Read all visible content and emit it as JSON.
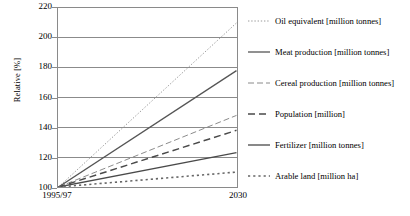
{
  "chart_data": {
    "type": "line",
    "title": "",
    "xlabel": "",
    "ylabel": "Relative [%]",
    "x": [
      "1995/97",
      "2030"
    ],
    "xtick_labels": [
      "1995/97",
      "2030"
    ],
    "ytick_labels": [
      "100",
      "120",
      "140",
      "160",
      "180",
      "200",
      "220"
    ],
    "ylim": [
      100,
      220
    ],
    "ytick_step": 20,
    "grid": true,
    "legend_position": "right",
    "series": [
      {
        "name": "Oil equivalent [million tonnes]",
        "values": [
          100,
          210
        ],
        "style": "dotted-fine",
        "color": "#9a9a9a"
      },
      {
        "name": "Meat production [million tonnes]",
        "values": [
          100,
          178
        ],
        "style": "solid",
        "color": "#555555"
      },
      {
        "name": "Cereal production [million tonnes]",
        "values": [
          100,
          148
        ],
        "style": "dash-dot",
        "color": "#8a8a8a"
      },
      {
        "name": "Population [million]",
        "values": [
          100,
          138
        ],
        "style": "dashed",
        "color": "#4a4a4a"
      },
      {
        "name": "Fertilizer [million tonnes]",
        "values": [
          100,
          123
        ],
        "style": "solid",
        "color": "#4a4a4a"
      },
      {
        "name": "Arable land [million ha]",
        "values": [
          100,
          110
        ],
        "style": "dotted-coarse",
        "color": "#666666"
      }
    ]
  },
  "axis": {
    "y_title": "Relative [%]",
    "y_ticks": [
      {
        "label": "220",
        "value": 220
      },
      {
        "label": "200",
        "value": 200
      },
      {
        "label": "180",
        "value": 180
      },
      {
        "label": "160",
        "value": 160
      },
      {
        "label": "140",
        "value": 140
      },
      {
        "label": "120",
        "value": 120
      },
      {
        "label": "100",
        "value": 100
      }
    ],
    "x_ticks": [
      {
        "label": "1995/97",
        "value": 0
      },
      {
        "label": "2030",
        "value": 1
      }
    ]
  },
  "legend": {
    "items": [
      {
        "label": "Oil equivalent [million tonnes]"
      },
      {
        "label": "Meat production [million tonnes]"
      },
      {
        "label": "Cereal production [million tonnes]"
      },
      {
        "label": "Population [million]"
      },
      {
        "label": "Fertilizer [million tonnes]"
      },
      {
        "label": "Arable land [million ha]"
      }
    ]
  },
  "colors": {
    "frame": "#8a8a8a",
    "grid": "#8a8a8a",
    "background": "#ffffff",
    "text": "#000000"
  }
}
